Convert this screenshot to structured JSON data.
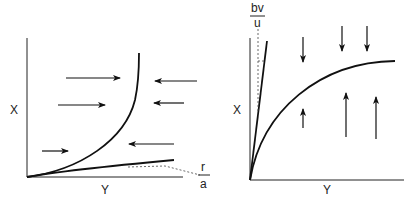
{
  "left_panel": {
    "y_axis_label": "X",
    "x_axis_label": "Y",
    "fraction_label": {
      "numerator": "r",
      "denominator": "a"
    },
    "arrows": [
      {
        "direction": "right",
        "x1": 66,
        "y1": 78,
        "x2": 120,
        "y2": 78
      },
      {
        "direction": "right",
        "x1": 58,
        "y1": 105,
        "x2": 105,
        "y2": 105
      },
      {
        "direction": "right",
        "x1": 42,
        "y1": 151,
        "x2": 68,
        "y2": 151
      },
      {
        "direction": "left",
        "x1": 197,
        "y1": 81,
        "x2": 155,
        "y2": 81
      },
      {
        "direction": "left",
        "x1": 184,
        "y1": 103,
        "x2": 154,
        "y2": 103
      },
      {
        "direction": "left",
        "x1": 174,
        "y1": 144,
        "x2": 129,
        "y2": 144
      }
    ]
  },
  "right_panel": {
    "y_axis_label": "X",
    "x_axis_label": "Y",
    "fraction_label": {
      "numerator": "bv",
      "denominator": "u"
    },
    "arrows": [
      {
        "direction": "down",
        "x1": 303,
        "y1": 37,
        "x2": 303,
        "y2": 62
      },
      {
        "direction": "down",
        "x1": 342,
        "y1": 26,
        "x2": 342,
        "y2": 51
      },
      {
        "direction": "down",
        "x1": 367,
        "y1": 26,
        "x2": 367,
        "y2": 51
      },
      {
        "direction": "up",
        "x1": 303,
        "y1": 128,
        "x2": 303,
        "y2": 109
      },
      {
        "direction": "up",
        "x1": 346,
        "y1": 137,
        "x2": 346,
        "y2": 93
      },
      {
        "direction": "up",
        "x1": 376,
        "y1": 139,
        "x2": 376,
        "y2": 97
      }
    ]
  }
}
